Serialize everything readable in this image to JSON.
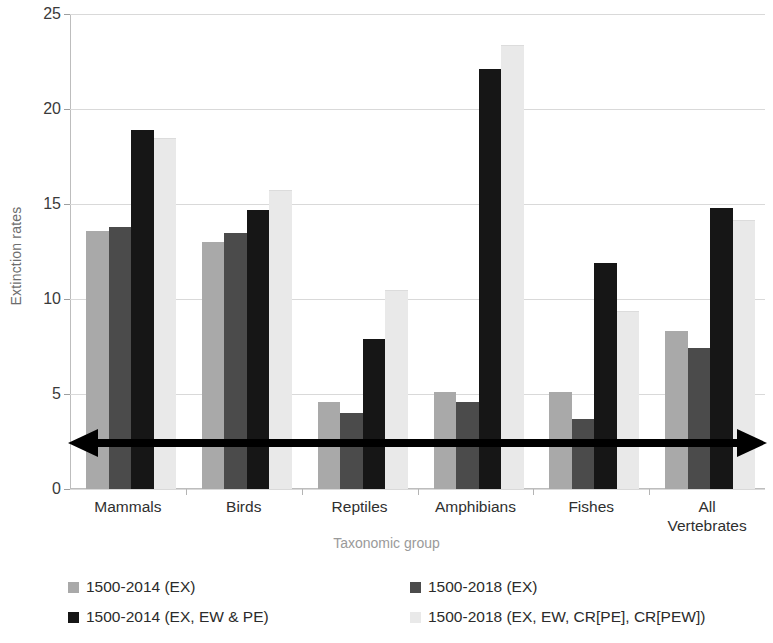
{
  "chart_data": {
    "type": "bar",
    "title": "",
    "xlabel": "Taxonomic group",
    "ylabel": "Extinction rates",
    "ylim": [
      0,
      25
    ],
    "yticks": [
      0,
      5,
      10,
      15,
      20,
      25
    ],
    "grid": true,
    "legend_position": "bottom",
    "categories": [
      "Mammals",
      "Birds",
      "Reptiles",
      "Amphibians",
      "Fishes",
      "All Vertebrates"
    ],
    "series": [
      {
        "name": "1500-2014 (EX)",
        "color": "#a9a9a9",
        "values": [
          13.6,
          13.0,
          4.6,
          5.1,
          5.1,
          8.3
        ]
      },
      {
        "name": "1500-2018 (EX)",
        "color": "#4b4b4b",
        "values": [
          13.8,
          13.5,
          4.0,
          4.6,
          3.7,
          7.4
        ]
      },
      {
        "name": "1500-2014 (EX, EW & PE)",
        "color": "#161616",
        "values": [
          18.9,
          14.7,
          7.9,
          22.1,
          11.9,
          14.8
        ]
      },
      {
        "name": "1500-2018 (EX, EW, CR[PE], CR[PEW])",
        "color": "#e9e9e9",
        "values": [
          18.4,
          15.7,
          10.4,
          23.3,
          9.3,
          14.1
        ]
      }
    ],
    "annotation": {
      "name": "double-headed-horizontal-arrow",
      "value_level": 2.4,
      "color": "#000000",
      "description": "double-headed horizontal arrow across the plot"
    }
  },
  "axis": {
    "y_tick_labels": [
      "0",
      "5",
      "10",
      "15",
      "20",
      "25"
    ],
    "y_title": "Extinction rates",
    "x_title": "Taxonomic group",
    "x_tick_labels": [
      "Mammals",
      "Birds",
      "Reptiles",
      "Amphibians",
      "All\nVertebrates"
    ]
  },
  "legend": {
    "items": [
      {
        "label": "1500-2014 (EX)",
        "color": "#a9a9a9"
      },
      {
        "label": "1500-2018 (EX)",
        "color": "#4b4b4b"
      },
      {
        "label": "1500-2014 (EX, EW & PE)",
        "color": "#161616"
      },
      {
        "label": "1500-2018 (EX, EW, CR[PE], CR[PEW])",
        "color": "#e9e9e9"
      }
    ]
  },
  "x_labels": [
    {
      "line1": "Mammals",
      "line2": ""
    },
    {
      "line1": "Birds",
      "line2": ""
    },
    {
      "line1": "Reptiles",
      "line2": ""
    },
    {
      "line1": "Amphibians",
      "line2": ""
    },
    {
      "line1": "Fishes",
      "line2": ""
    },
    {
      "line1": "All",
      "line2": "Vertebrates"
    }
  ]
}
